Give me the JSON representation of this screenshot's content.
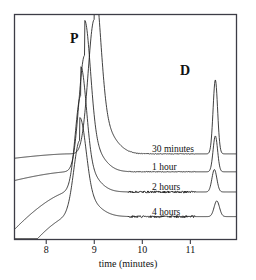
{
  "chart_data": {
    "type": "line",
    "title": "",
    "subtitle": "",
    "xlabel": "time (minutes)",
    "ylabel": "",
    "xlim": [
      7.35,
      11.95
    ],
    "ylim": [
      0,
      1
    ],
    "xticks": [
      8,
      9,
      10,
      11
    ],
    "xtick_labels": [
      "8",
      "9",
      "10",
      "11"
    ],
    "yticks": [],
    "grid": false,
    "legend_position": "inline-right",
    "annotations": [
      {
        "text": "P",
        "x": 8.52,
        "y": 0.86,
        "note": "parent compound peak"
      },
      {
        "text": "D",
        "x": 11.28,
        "y": 0.72,
        "note": "degradant peak"
      }
    ],
    "series": [
      {
        "name": "30 minutes",
        "baseline_offset": 0.38,
        "peaks": [
          {
            "label": "P",
            "x": 9.0,
            "height": 0.6,
            "width": 0.3
          },
          {
            "label": "D",
            "x": 11.52,
            "height": 0.33,
            "width": 0.11
          }
        ]
      },
      {
        "name": "1 hour",
        "baseline_offset": 0.3,
        "peaks": [
          {
            "label": "P",
            "x": 8.8,
            "height": 0.52,
            "width": 0.28
          },
          {
            "label": "D",
            "x": 11.52,
            "height": 0.16,
            "width": 0.11
          }
        ]
      },
      {
        "name": "2 hours",
        "baseline_offset": 0.21,
        "peaks": [
          {
            "label": "P",
            "x": 8.72,
            "height": 0.43,
            "width": 0.27
          },
          {
            "label": "D",
            "x": 11.5,
            "height": 0.1,
            "width": 0.12
          }
        ]
      },
      {
        "name": "4 hours",
        "baseline_offset": 0.1,
        "peaks": [
          {
            "label": "P",
            "x": 8.7,
            "height": 0.34,
            "width": 0.3
          },
          {
            "label": "D",
            "x": 11.55,
            "height": 0.07,
            "width": 0.13
          }
        ]
      }
    ],
    "colors": {
      "trace": "#1f1f1f",
      "frame": "#3c3c46",
      "background": "#ffffff"
    }
  },
  "figure": {
    "peak_labels": {
      "parent": "P",
      "degradant": "D"
    },
    "trace_labels": [
      "30 minutes",
      "1 hour",
      "2 hours",
      "4 hours"
    ],
    "axis": {
      "title": "time (minutes)",
      "tick_labels": [
        "8",
        "9",
        "10",
        "11"
      ]
    }
  }
}
